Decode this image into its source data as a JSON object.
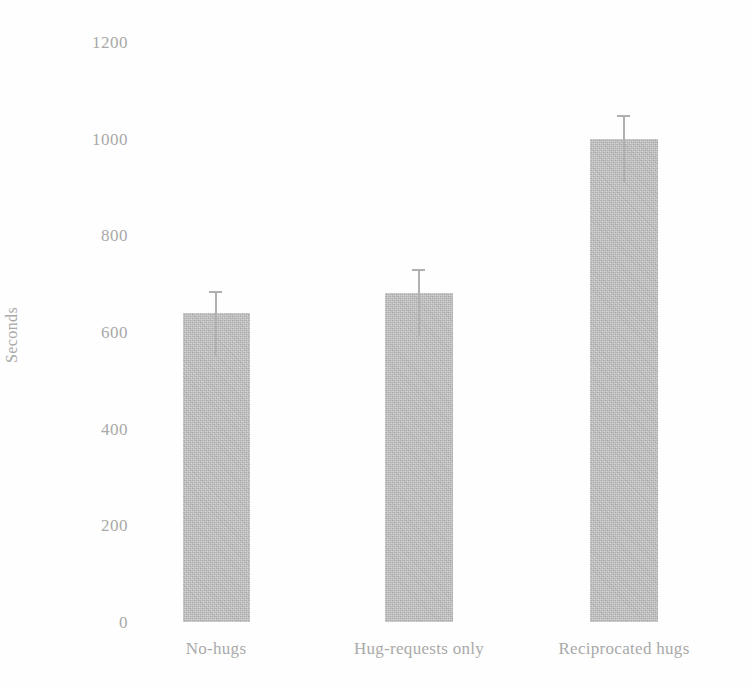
{
  "chart_data": {
    "type": "bar",
    "title": "",
    "xlabel": "",
    "ylabel": "Seconds",
    "categories": [
      "No-hugs",
      "Hug-requests only",
      "Reciprocated hugs"
    ],
    "values": [
      640,
      680,
      1000
    ],
    "errors_upper": [
      45,
      50,
      48
    ],
    "ylim": [
      0,
      1200
    ],
    "yticks": [
      0,
      200,
      400,
      600,
      800,
      1000,
      1200
    ],
    "ytick_labels": [
      "0",
      "200",
      "400",
      "600",
      "800",
      "1000",
      "1200"
    ],
    "grid": false,
    "legend": false,
    "legend_position": "none",
    "bar_color": "#bdbdbd",
    "error_bar_color": "#b0b0b0",
    "text_color": "#a9a9a9",
    "background_color": "#fefefe",
    "error_bars": "upper-only",
    "series": [
      {
        "name": "Seconds",
        "values": [
          640,
          680,
          1000
        ]
      }
    ]
  }
}
